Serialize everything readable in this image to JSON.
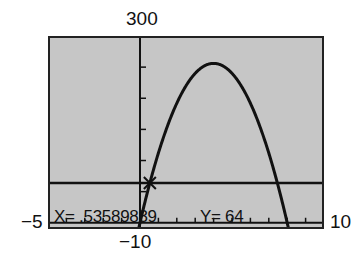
{
  "window": {
    "xmin_label": "−5",
    "xmax_label": "10",
    "ymin_label": "−10",
    "ymax_label": "300"
  },
  "trace": {
    "x_readout": "X= .53589839",
    "y_readout": "Y= 64"
  },
  "colors": {
    "screen_bg": "#c6c6c6",
    "ink": "#111111"
  },
  "chart_data": {
    "type": "line",
    "title": "",
    "xlabel": "",
    "ylabel": "",
    "xlim": [
      -5,
      10
    ],
    "ylim": [
      -10,
      300
    ],
    "xscl": 1,
    "yscl": 50,
    "grid": false,
    "series": [
      {
        "name": "Y1 = -16x^2 + 128x",
        "function": "-16*x^2+128*x",
        "vertex": [
          4,
          256
        ],
        "roots": [
          0,
          8
        ]
      },
      {
        "name": "Y2 = 64",
        "function": "64",
        "intersections_with_Y1": [
          0.53589839,
          7.46410161
        ]
      }
    ],
    "cursor": {
      "x": 0.53589839,
      "y": 64,
      "marker": "X"
    },
    "annotations": [
      "X= .53589839",
      "Y= 64"
    ]
  }
}
